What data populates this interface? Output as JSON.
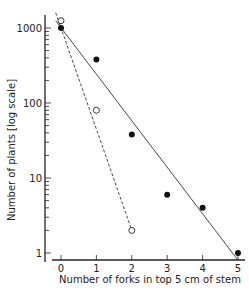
{
  "chart_data": {
    "type": "scatter",
    "title": "",
    "xlabel": "Number of forks in top 5 cm of stem",
    "ylabel": "Number of plants [log scale]",
    "x_ticks": [
      "0",
      "1",
      "2",
      "3",
      "4",
      "5"
    ],
    "y_ticks": [
      "1",
      "10",
      "100",
      "1000"
    ],
    "yscale": "log",
    "xlim": [
      -0.3,
      5.1
    ],
    "ylim": [
      0.7,
      2000
    ],
    "grid": false,
    "legend": null,
    "series": [
      {
        "name": "filled circles",
        "marker": "filled-circle",
        "x": [
          0,
          1,
          2,
          3,
          4,
          5
        ],
        "y": [
          1000,
          380,
          38,
          6,
          4,
          1
        ],
        "fit_line": {
          "style": "solid",
          "x": [
            -0.15,
            5.0
          ],
          "y": [
            1250,
            0.8
          ]
        }
      },
      {
        "name": "open circles",
        "marker": "open-circle",
        "x": [
          0,
          1,
          2
        ],
        "y": [
          1250,
          80,
          2
        ],
        "fit_line": {
          "style": "dashed",
          "x": [
            -0.15,
            2.0
          ],
          "y": [
            1600,
            2
          ]
        }
      }
    ]
  }
}
